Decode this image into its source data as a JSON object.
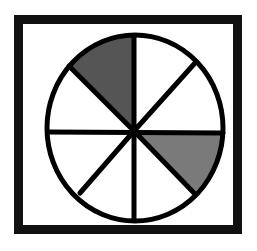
{
  "figure": {
    "total_sectors": 8,
    "shaded_sectors": 2,
    "fraction_shaded": "2/8",
    "frame": {
      "x": 14,
      "y": 15,
      "width": 228,
      "height": 219,
      "stroke": "#111111",
      "stroke_width": 9
    },
    "circle": {
      "cx": 135,
      "cy": 128,
      "rx": 88,
      "ry": 93,
      "stroke": "#000000",
      "stroke_width": 5
    },
    "sectors": [
      {
        "id": "top-left",
        "shaded": true,
        "fill": "#555555"
      },
      {
        "id": "top-right-upper",
        "shaded": false,
        "fill": "#ffffff"
      },
      {
        "id": "top-right-lower",
        "shaded": false,
        "fill": "#ffffff"
      },
      {
        "id": "bottom-right-upper",
        "shaded": true,
        "fill": "#7a7a7a"
      },
      {
        "id": "bottom-right-lower",
        "shaded": false,
        "fill": "#ffffff"
      },
      {
        "id": "bottom-left-lower",
        "shaded": false,
        "fill": "#ffffff"
      },
      {
        "id": "bottom-left-upper",
        "shaded": false,
        "fill": "#ffffff"
      },
      {
        "id": "top-left-lower",
        "shaded": false,
        "fill": "#ffffff"
      }
    ],
    "colors": {
      "line": "#000000",
      "dark_shade": "#555555",
      "light_shade": "#7a7a7a",
      "background": "#ffffff"
    }
  }
}
